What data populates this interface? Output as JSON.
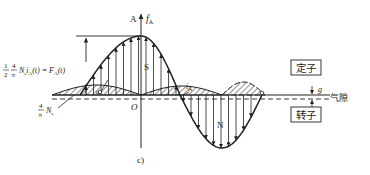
{
  "figure": {
    "caption": "c)",
    "axis_label_A": "A",
    "axis_label_f": "f",
    "axis_label_f_sub": "A",
    "origin_label": "O",
    "pole_S": "S",
    "pole_N": "N",
    "current_label": "i",
    "current_sub": "A",
    "conductor_marker": "a",
    "gap_symbol": "g",
    "gap_text": "气隙",
    "stator_label": "定子",
    "rotor_label": "转子",
    "amplitude_formula": {
      "frac1_num": "1",
      "frac1_den": "2",
      "frac2_num": "4",
      "frac2_den": "π",
      "body": "N",
      "body_sub": "s",
      "body2": "i",
      "body2_sub": "A",
      "body3": "(t) = F",
      "body3_sub": "A",
      "body4": "(t)"
    },
    "slot_formula": {
      "frac_num": "4",
      "frac_den": "π",
      "body": "N",
      "body_sub": "s"
    }
  },
  "colors": {
    "ink": "#222222",
    "background": "#ffffff"
  }
}
